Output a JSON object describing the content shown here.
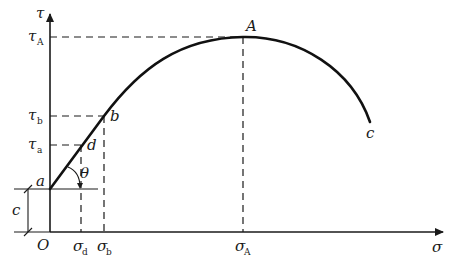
{
  "diagram": {
    "type": "stress-strength curve (Mohr-Coulomb style shear vs normal stress)",
    "axes": {
      "y_label": "τ",
      "x_label": "σ",
      "origin_label": "O"
    },
    "y_ticks": [
      {
        "base": "τ",
        "sub": "A"
      },
      {
        "base": "τ",
        "sub": "b"
      },
      {
        "base": "τ",
        "sub": "a"
      }
    ],
    "x_ticks": [
      {
        "base": "σ",
        "sub": "d"
      },
      {
        "base": "σ",
        "sub": "b"
      },
      {
        "base": "σ",
        "sub": "A"
      }
    ],
    "points": {
      "a": "a",
      "b": "b",
      "d": "d",
      "A": "A",
      "c_end": "c"
    },
    "angle_label": "θ",
    "intercept_label": "c",
    "colors": {
      "line": "#111111",
      "background": "#ffffff"
    }
  }
}
